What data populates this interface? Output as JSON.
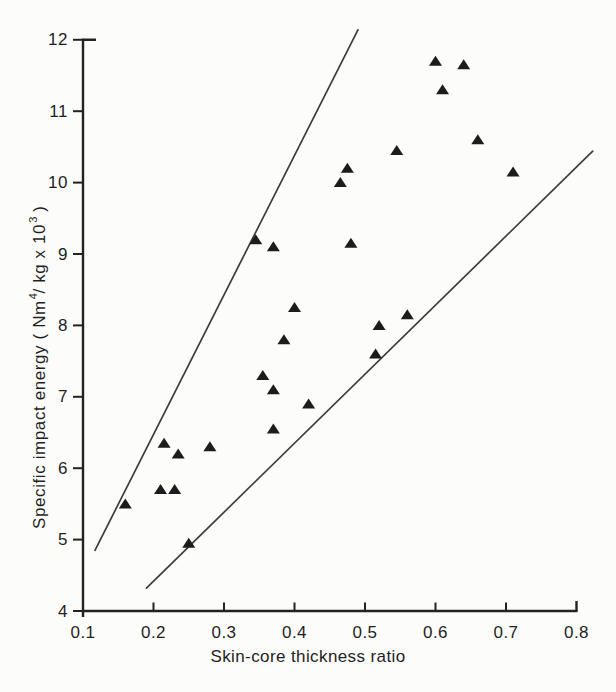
{
  "figure": {
    "background": "#fcfcfa",
    "ink_color": "#1f1f1f"
  },
  "chart_data": {
    "type": "scatter",
    "title": "",
    "xlabel": "Skin-core thickness ratio",
    "ylabel": "Specific impact energy (Nm⁴/kg x 10³)",
    "ylabel_parts": {
      "p1": "Specific impact energy ( Nm",
      "sup1": "4",
      "p2": "/ kg  x  10",
      "sup2": "3",
      "p3": " )"
    },
    "xlim": [
      0.1,
      0.8
    ],
    "ylim": [
      4,
      12
    ],
    "grid": false,
    "legend": null,
    "axis_color": "#222222",
    "line_color": "#3d3d3d",
    "marker": "filled-triangle-up",
    "marker_color": "#1c1c1c",
    "x_ticks": [
      {
        "v": 0.1,
        "label": "0.1"
      },
      {
        "v": 0.2,
        "label": "0.2"
      },
      {
        "v": 0.3,
        "label": "0.3"
      },
      {
        "v": 0.4,
        "label": "0.4"
      },
      {
        "v": 0.5,
        "label": "0.5"
      },
      {
        "v": 0.6,
        "label": "0.6"
      },
      {
        "v": 0.7,
        "label": "0.7"
      },
      {
        "v": 0.8,
        "label": "0.8"
      }
    ],
    "y_ticks": [
      {
        "v": 4,
        "label": "4"
      },
      {
        "v": 5,
        "label": "5"
      },
      {
        "v": 6,
        "label": "6"
      },
      {
        "v": 7,
        "label": "7"
      },
      {
        "v": 8,
        "label": "8"
      },
      {
        "v": 9,
        "label": "9"
      },
      {
        "v": 10,
        "label": "10"
      },
      {
        "v": 11,
        "label": "11"
      },
      {
        "v": 12,
        "label": "12"
      }
    ],
    "series": [
      {
        "name": "specimens",
        "points": [
          [
            0.6,
            11.7
          ],
          [
            0.64,
            11.65
          ],
          [
            0.61,
            11.3
          ],
          [
            0.66,
            10.6
          ],
          [
            0.545,
            10.45
          ],
          [
            0.475,
            10.2
          ],
          [
            0.465,
            10.0
          ],
          [
            0.71,
            10.15
          ],
          [
            0.48,
            9.15
          ],
          [
            0.345,
            9.2
          ],
          [
            0.37,
            9.1
          ],
          [
            0.4,
            8.25
          ],
          [
            0.385,
            7.8
          ],
          [
            0.355,
            7.3
          ],
          [
            0.37,
            7.1
          ],
          [
            0.42,
            6.9
          ],
          [
            0.52,
            8.0
          ],
          [
            0.56,
            8.15
          ],
          [
            0.515,
            7.6
          ],
          [
            0.215,
            6.35
          ],
          [
            0.235,
            6.2
          ],
          [
            0.28,
            6.3
          ],
          [
            0.37,
            6.55
          ],
          [
            0.21,
            5.7
          ],
          [
            0.23,
            5.7
          ],
          [
            0.16,
            5.5
          ],
          [
            0.25,
            4.95
          ]
        ]
      }
    ],
    "boundary_lines": [
      {
        "name": "upper-boundary-line",
        "from": [
          0.117,
          4.85
        ],
        "to": [
          0.49,
          12.14
        ]
      },
      {
        "name": "lower-boundary-line",
        "from": [
          0.19,
          4.32
        ],
        "to": [
          0.823,
          10.44
        ]
      }
    ]
  }
}
